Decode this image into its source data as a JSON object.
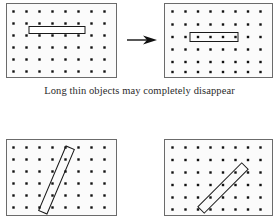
{
  "figure": {
    "title": "Long thin objects may completely disappear",
    "caption": "Long thin objects may completely disappear",
    "background_color": "#ffffff",
    "panel_fill": "#fbfbfb",
    "panel_border_color": "#6b6b6b",
    "dot_color": "#111111",
    "object_stroke_color": "#1a1a1a",
    "arrow_color": "#111111"
  },
  "grid": {
    "columns": 9,
    "rows": 6,
    "dot_size_px": 2.4,
    "description": "regular square lattice of sample points"
  },
  "panels": [
    {
      "id": "top-left",
      "name": "panel-top-left",
      "label": "Long thin horizontal object before sampling",
      "x": 6,
      "y": 3,
      "width": 111,
      "height": 75,
      "object": {
        "shape": "rectangle",
        "orientation": "horizontal",
        "angle_deg": 0,
        "center_x": 50,
        "center_y": 26,
        "length": 56,
        "thickness": 7,
        "contains_dots": false,
        "note": "thin bar lies between two rows of sample points"
      }
    },
    {
      "id": "top-right",
      "name": "panel-top-right",
      "label": "Same object shifted onto a row of sample points",
      "x": 164,
      "y": 3,
      "width": 109,
      "height": 75,
      "object": {
        "shape": "rectangle",
        "orientation": "horizontal",
        "angle_deg": 0,
        "center_x": 48,
        "center_y": 33,
        "length": 48,
        "thickness": 8,
        "contains_dots": true,
        "dots_inside": 4,
        "note": "bar now covers four sample points"
      }
    },
    {
      "id": "bottom-left",
      "name": "panel-bottom-left",
      "label": "Steep diagonal thin object",
      "x": 6,
      "y": 139,
      "width": 111,
      "height": 77,
      "object": {
        "shape": "rectangle",
        "orientation": "diagonal-steep",
        "angle_deg": -67,
        "center_x": 50,
        "center_y": 40,
        "length": 70,
        "thickness": 9,
        "contains_dots": true,
        "dots_inside": 4,
        "note": "steeply tilted bar crossing several rows"
      }
    },
    {
      "id": "bottom-right",
      "name": "panel-bottom-right",
      "label": "45 degree diagonal thin object",
      "x": 164,
      "y": 139,
      "width": 109,
      "height": 77,
      "object": {
        "shape": "rectangle",
        "orientation": "diagonal-45",
        "angle_deg": -45,
        "center_x": 58,
        "center_y": 48,
        "length": 62,
        "thickness": 9,
        "contains_dots": true,
        "dots_inside": 5,
        "note": "bar tilted at 45 degrees covering a diagonal of sample points"
      }
    }
  ],
  "arrow": {
    "name": "transition-arrow",
    "direction": "right",
    "from_panel": "top-left",
    "to_panel": "top-right",
    "x": 126,
    "y": 34,
    "width": 30,
    "height": 12
  }
}
